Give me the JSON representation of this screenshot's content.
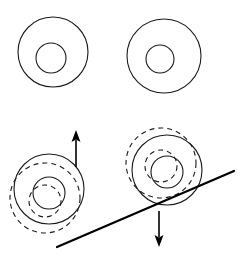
{
  "figure": {
    "title": "",
    "canvas": {
      "width": 245,
      "height": 256,
      "background": "#ffffff"
    },
    "colors": {
      "stroke": "#1a1a1a",
      "incline": "#000000",
      "arrow": "#000000",
      "background": "#ffffff"
    },
    "shapes": {
      "top_left_annulus": {
        "label": "top-left annulus",
        "outer": {
          "cx": 53,
          "cy": 52,
          "r": 35,
          "style": "solid"
        },
        "inner": {
          "cx": 51,
          "cy": 58,
          "r": 15,
          "style": "solid"
        }
      },
      "top_right_annulus": {
        "label": "top-right annulus",
        "outer": {
          "cx": 164,
          "cy": 56,
          "r": 37,
          "style": "solid"
        },
        "inner": {
          "cx": 160,
          "cy": 59,
          "r": 14,
          "style": "solid"
        }
      },
      "bottom_left_annulus": {
        "label": "bottom-left annulus with displaced dashed outline",
        "outer": {
          "cx": 49,
          "cy": 189,
          "r": 35,
          "style": "solid"
        },
        "inner": {
          "cx": 49,
          "cy": 193,
          "r": 16,
          "style": "solid"
        },
        "outer_ghost": {
          "cx": 45,
          "cy": 198,
          "r": 35,
          "style": "dashed"
        },
        "inner_ghost": {
          "cx": 45,
          "cy": 201,
          "r": 16,
          "style": "dashed"
        }
      },
      "bottom_right_annulus": {
        "label": "bottom-right annulus with displaced dashed outline",
        "outer": {
          "cx": 167,
          "cy": 170,
          "r": 35,
          "style": "solid"
        },
        "inner": {
          "cx": 167,
          "cy": 172,
          "r": 16,
          "style": "solid"
        },
        "outer_ghost": {
          "cx": 161,
          "cy": 163,
          "r": 35,
          "style": "dashed"
        },
        "inner_ghost": {
          "cx": 161,
          "cy": 166,
          "r": 16,
          "style": "dashed"
        }
      }
    },
    "incline": {
      "label": "inclined surface line",
      "x1": 57,
      "y1": 247,
      "x2": 234,
      "y2": 171
    },
    "arrows": [
      {
        "name": "up-arrow",
        "direction": "up",
        "x": 76,
        "y_start": 167,
        "y_end": 130
      },
      {
        "name": "down-arrow",
        "direction": "down",
        "x": 159,
        "y_start": 211,
        "y_end": 247
      }
    ]
  }
}
